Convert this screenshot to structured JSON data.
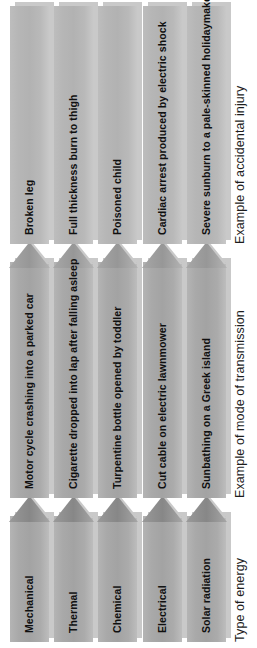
{
  "diagram": {
    "columns": [
      {
        "id": "energy",
        "heading": "Type of energy"
      },
      {
        "id": "transmission",
        "heading": "Example of mode of transmission"
      },
      {
        "id": "injury",
        "heading": "Example of accidental injury"
      }
    ],
    "rows": [
      {
        "energy": "Mechanical",
        "transmission": "Motor cycle crashing into a parked car",
        "injury": "Broken leg"
      },
      {
        "energy": "Thermal",
        "transmission": "Cigarette dropped into lap after falling asleep",
        "injury": "Full thickness burn to thigh"
      },
      {
        "energy": "Chemical",
        "transmission": "Turpentine bottle opened by toddler",
        "injury": "Poisoned child"
      },
      {
        "energy": "Electrical",
        "transmission": "Cut cable on electric lawnmower",
        "injury": "Cardiac arrest produced by electric shock"
      },
      {
        "energy": "Solar radiation",
        "transmission": "Sunbathing on a Greek island",
        "injury": "Severe sunburn to a pale-skinned holidaymaker"
      }
    ],
    "colors": {
      "background": "#ffffff",
      "bar_mid": "#a3a3a3",
      "bar_light": "#b2b2b2",
      "arrowhead": "#8e8e8e",
      "shadow": "#c9c9c9",
      "text": "#101010",
      "heading_text": "#1d1d1d"
    }
  }
}
